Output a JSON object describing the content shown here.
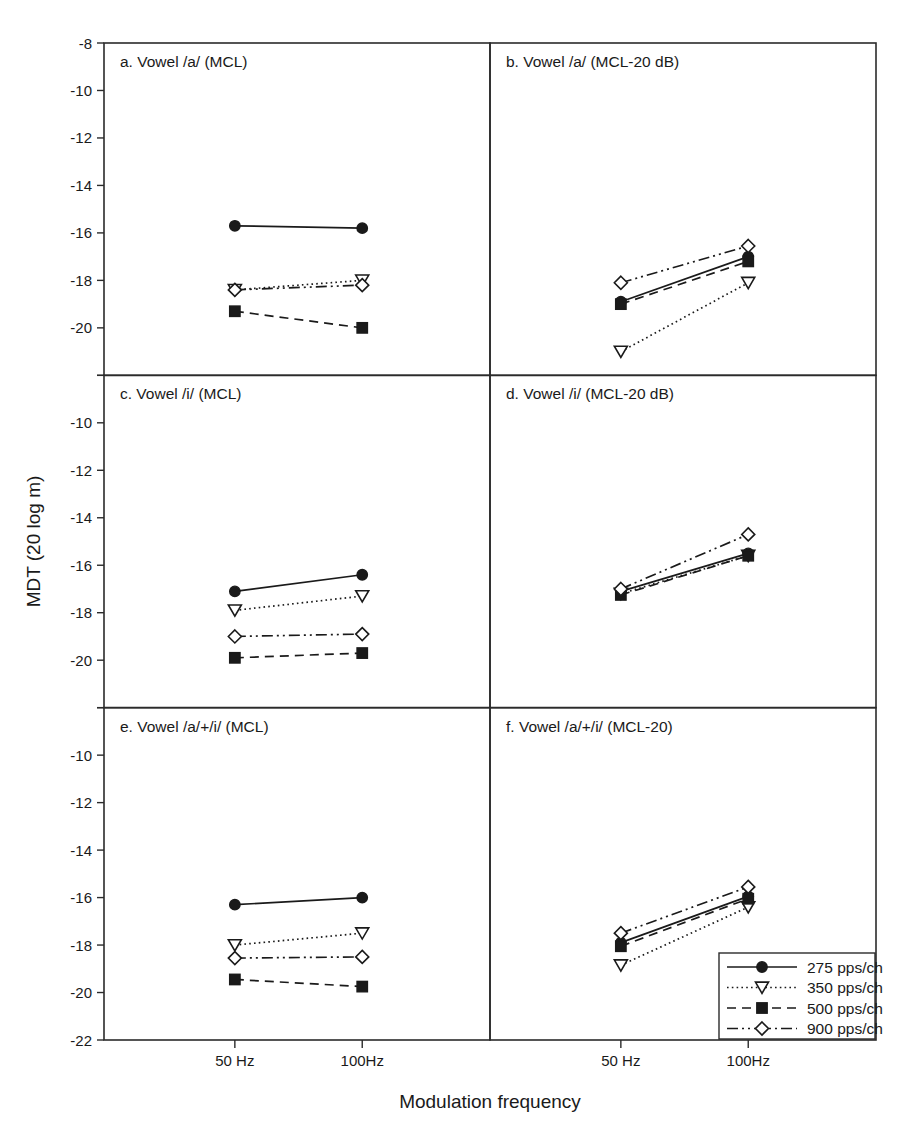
{
  "figure": {
    "ylabel": "MDT (20 log m)",
    "xlabel": "Modulation frequency",
    "background": "#ffffff",
    "ink": "#1a1a1a"
  },
  "chart_data": {
    "type": "line",
    "title": "",
    "xlabel": "Modulation frequency",
    "ylabel": "MDT (20 log m)",
    "x": [
      "50 Hz",
      "100Hz"
    ],
    "categories": [
      "50 Hz",
      "100Hz"
    ],
    "ylim": [
      -22,
      -8
    ],
    "yticks": [
      -8,
      -10,
      -12,
      -14,
      -16,
      -18,
      -20,
      -22
    ],
    "ytick_labels": [
      "-8",
      "-10",
      "-12",
      "-14",
      "-16",
      "-18",
      "-20",
      "-22"
    ],
    "grid": false,
    "legend_position": "bottom-right (panel f)",
    "legend": [
      {
        "name": "275 pps/ch",
        "marker": "filled-circle",
        "dash": "solid"
      },
      {
        "name": "350 pps/ch",
        "marker": "open-triangle-down",
        "dash": "dotted"
      },
      {
        "name": "500 pps/ch",
        "marker": "filled-square",
        "dash": "dashed"
      },
      {
        "name": "900 pps/ch",
        "marker": "open-diamond",
        "dash": "dash-dot-dot"
      }
    ],
    "panels": [
      {
        "id": "a",
        "title": "a. Vowel /a/ (MCL)",
        "series": [
          {
            "name": "275 pps/ch",
            "values": [
              -15.7,
              -15.8
            ]
          },
          {
            "name": "350 pps/ch",
            "values": [
              -18.4,
              -18.0
            ]
          },
          {
            "name": "500 pps/ch",
            "values": [
              -19.3,
              -20.0
            ]
          },
          {
            "name": "900 pps/ch",
            "values": [
              -18.4,
              -18.2
            ]
          }
        ]
      },
      {
        "id": "b",
        "title": "b. Vowel /a/ (MCL-20 dB)",
        "series": [
          {
            "name": "275 pps/ch",
            "values": [
              -18.9,
              -17.0
            ]
          },
          {
            "name": "350 pps/ch",
            "values": [
              -21.0,
              -18.1
            ]
          },
          {
            "name": "500 pps/ch",
            "values": [
              -19.0,
              -17.2
            ]
          },
          {
            "name": "900 pps/ch",
            "values": [
              -18.1,
              -16.55
            ]
          }
        ]
      },
      {
        "id": "c",
        "title": "c. Vowel /i/ (MCL)",
        "series": [
          {
            "name": "275 pps/ch",
            "values": [
              -17.1,
              -16.4
            ]
          },
          {
            "name": "350 pps/ch",
            "values": [
              -17.9,
              -17.3
            ]
          },
          {
            "name": "500 pps/ch",
            "values": [
              -19.9,
              -19.7
            ]
          },
          {
            "name": "900 pps/ch",
            "values": [
              -19.0,
              -18.9
            ]
          }
        ]
      },
      {
        "id": "d",
        "title": "d. Vowel /i/ (MCL-20 dB)",
        "series": [
          {
            "name": "275 pps/ch",
            "values": [
              -17.1,
              -15.5
            ]
          },
          {
            "name": "350 pps/ch",
            "values": [
              -17.2,
              -15.6
            ]
          },
          {
            "name": "500 pps/ch",
            "values": [
              -17.25,
              -15.6
            ]
          },
          {
            "name": "900 pps/ch",
            "values": [
              -17.0,
              -14.7
            ]
          }
        ]
      },
      {
        "id": "e",
        "title": "e. Vowel /a/+/i/ (MCL)",
        "series": [
          {
            "name": "275 pps/ch",
            "values": [
              -16.3,
              -16.0
            ]
          },
          {
            "name": "350 pps/ch",
            "values": [
              -18.0,
              -17.5
            ]
          },
          {
            "name": "500 pps/ch",
            "values": [
              -19.45,
              -19.75
            ]
          },
          {
            "name": "900 pps/ch",
            "values": [
              -18.55,
              -18.5
            ]
          }
        ]
      },
      {
        "id": "f",
        "title": "f. Vowel /a/+/i/ (MCL-20)",
        "series": [
          {
            "name": "275 pps/ch",
            "values": [
              -17.9,
              -15.95
            ]
          },
          {
            "name": "350 pps/ch",
            "values": [
              -18.85,
              -16.4
            ]
          },
          {
            "name": "500 pps/ch",
            "values": [
              -18.05,
              -16.05
            ]
          },
          {
            "name": "900 pps/ch",
            "values": [
              -17.5,
              -15.55
            ]
          }
        ]
      }
    ]
  }
}
